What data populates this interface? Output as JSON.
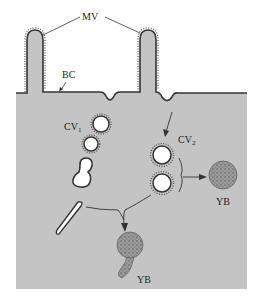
{
  "diagram": {
    "type": "cell-biology-schematic",
    "colors": {
      "cytoplasm": "#c4c4c4",
      "membrane": "#333333",
      "vesicle_fill": "#ffffff",
      "yolk_body": "#8a8a8a",
      "background": "#ffffff"
    },
    "labels": {
      "mv": "MV",
      "bc": "BC",
      "cv1_main": "CV",
      "cv1_sub": "1",
      "cv2_main": "CV",
      "cv2_sub": "2",
      "yb_right": "YB",
      "yb_bottom": "YB"
    },
    "nodes": [
      {
        "id": "MV",
        "label": "MV",
        "meaning": "microvilli"
      },
      {
        "id": "BC",
        "label": "BC",
        "meaning": "bristle coat"
      },
      {
        "id": "CV1",
        "label": "CV1",
        "meaning": "coated vesicle type 1"
      },
      {
        "id": "CV2",
        "label": "CV2",
        "meaning": "coated vesicle type 2"
      },
      {
        "id": "YB1",
        "label": "YB",
        "meaning": "yolk body"
      },
      {
        "id": "YB2",
        "label": "YB",
        "meaning": "yolk body (with tubule)"
      }
    ],
    "edges": [
      {
        "from": "membrane-pit",
        "to": "CV2"
      },
      {
        "from": "CV2",
        "to": "YB1"
      },
      {
        "from": "tubule",
        "to": "YB2"
      },
      {
        "from": "CV2",
        "to": "YB2"
      }
    ]
  }
}
